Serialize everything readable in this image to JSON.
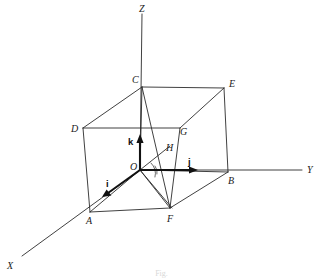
{
  "figure": {
    "caption": "Fig.",
    "stroke_color": "#2b2b2b",
    "bold_stroke_color": "#111111",
    "background": "#ffffff"
  },
  "axes": [
    {
      "name": "z-axis",
      "label": "Z",
      "direction": "up",
      "label_x": 139,
      "label_y": 4
    },
    {
      "name": "y-axis",
      "label": "Y",
      "direction": "right",
      "label_x": 307,
      "label_y": 165
    },
    {
      "name": "x-axis",
      "label": "X",
      "direction": "down-left",
      "label_x": 7,
      "label_y": 261
    }
  ],
  "vertices": [
    {
      "label": "O",
      "name": "origin",
      "x": 140,
      "y": 170,
      "label_x": 130,
      "label_y": 162
    },
    {
      "label": "A",
      "name": "vertex-a",
      "x": 90,
      "y": 212,
      "label_x": 86,
      "label_y": 216
    },
    {
      "label": "B",
      "name": "vertex-b",
      "x": 228,
      "y": 172,
      "label_x": 228,
      "label_y": 176
    },
    {
      "label": "C",
      "name": "vertex-c",
      "x": 142,
      "y": 87,
      "label_x": 132,
      "label_y": 75
    },
    {
      "label": "D",
      "name": "vertex-d",
      "x": 83,
      "y": 128,
      "label_x": 71,
      "label_y": 124
    },
    {
      "label": "E",
      "name": "vertex-e",
      "x": 224,
      "y": 88,
      "label_x": 229,
      "label_y": 79
    },
    {
      "label": "F",
      "name": "vertex-f",
      "x": 170,
      "y": 208,
      "label_x": 167,
      "label_y": 214
    },
    {
      "label": "G",
      "name": "vertex-g",
      "x": 180,
      "y": 128,
      "label_x": 180,
      "label_y": 127
    },
    {
      "label": "H",
      "name": "vertex-h",
      "x": 168,
      "y": 152,
      "label_x": 166,
      "label_y": 143
    }
  ],
  "unit_vectors": [
    {
      "label": "i",
      "name": "unit-vector-i",
      "from_x": 140,
      "from_y": 170,
      "to_x": 104,
      "to_y": 196,
      "label_x": 106,
      "label_y": 179
    },
    {
      "label": "j",
      "name": "unit-vector-j",
      "from_x": 140,
      "from_y": 170,
      "to_x": 196,
      "to_y": 170,
      "label_x": 188,
      "label_y": 157
    },
    {
      "label": "k",
      "name": "unit-vector-k",
      "from_x": 140,
      "from_y": 170,
      "to_x": 140,
      "to_y": 138,
      "label_x": 128,
      "label_y": 137
    }
  ]
}
